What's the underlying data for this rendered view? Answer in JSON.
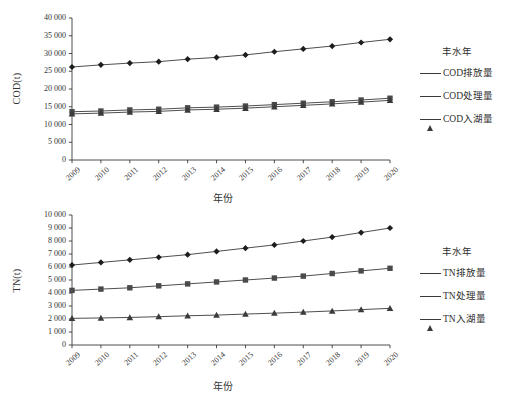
{
  "figure": {
    "background": "#ffffff",
    "line_color": "#3a3a3a",
    "axis_color": "#3a3a3a",
    "text_color": "#2f2f2f"
  },
  "chart_data": [
    {
      "id": "cod",
      "type": "line",
      "title": "",
      "xlabel": "年份",
      "ylabel": "COD(t)",
      "legend_title": "丰水年",
      "legend_position": "right",
      "grid": false,
      "categories": [
        "2009",
        "2010",
        "2011",
        "2012",
        "2013",
        "2014",
        "2015",
        "2016",
        "2017",
        "2018",
        "2019",
        "2020"
      ],
      "xlim": [
        2009,
        2020
      ],
      "ylim": [
        0,
        40000
      ],
      "ytick_step": 5000,
      "yticks": [
        "0",
        "5 000",
        "10 000",
        "15 000",
        "20 000",
        "25 000",
        "30 000",
        "35 000",
        "40 000"
      ],
      "ytick_values": [
        0,
        5000,
        10000,
        15000,
        20000,
        25000,
        30000,
        35000,
        40000
      ],
      "series": [
        {
          "name": "COD排放量",
          "marker": "diamond",
          "color": "#1d1d1d",
          "values": [
            26200,
            26800,
            27300,
            27700,
            28400,
            28900,
            29600,
            30500,
            31300,
            32100,
            33100,
            34000
          ]
        },
        {
          "name": "COD处理量",
          "marker": "square",
          "color": "#4a4a4a",
          "values": [
            13600,
            13800,
            14100,
            14300,
            14700,
            14900,
            15200,
            15600,
            16000,
            16400,
            16900,
            17400
          ]
        },
        {
          "name": "COD入湖量",
          "marker": "triangle",
          "color": "#3a3a3a",
          "values": [
            13000,
            13200,
            13500,
            13700,
            14100,
            14300,
            14600,
            15000,
            15400,
            15800,
            16300,
            16800
          ]
        }
      ]
    },
    {
      "id": "tn",
      "type": "line",
      "title": "",
      "xlabel": "年份",
      "ylabel": "TN(t)",
      "legend_title": "丰水年",
      "legend_position": "right",
      "grid": false,
      "categories": [
        "2009",
        "2010",
        "2011",
        "2012",
        "2013",
        "2014",
        "2015",
        "2016",
        "2017",
        "2018",
        "2019",
        "2020"
      ],
      "xlim": [
        2009,
        2020
      ],
      "ylim": [
        0,
        10000
      ],
      "ytick_step": 1000,
      "yticks": [
        "0",
        "1 000",
        "2 000",
        "3 000",
        "4 000",
        "5 000",
        "6 000",
        "7 000",
        "8 000",
        "9 000",
        "10 000"
      ],
      "ytick_values": [
        0,
        1000,
        2000,
        3000,
        4000,
        5000,
        6000,
        7000,
        8000,
        9000,
        10000
      ],
      "series": [
        {
          "name": "TN排放量",
          "marker": "diamond",
          "color": "#1d1d1d",
          "values": [
            6150,
            6350,
            6550,
            6750,
            6950,
            7200,
            7450,
            7700,
            8000,
            8300,
            8650,
            9000
          ]
        },
        {
          "name": "TN处理量",
          "marker": "square",
          "color": "#4a4a4a",
          "values": [
            4200,
            4300,
            4400,
            4550,
            4700,
            4850,
            5000,
            5150,
            5300,
            5500,
            5700,
            5900
          ]
        },
        {
          "name": "TN入湖量",
          "marker": "triangle",
          "color": "#3a3a3a",
          "values": [
            2050,
            2080,
            2120,
            2180,
            2250,
            2300,
            2380,
            2450,
            2530,
            2620,
            2720,
            2820
          ]
        }
      ]
    }
  ]
}
